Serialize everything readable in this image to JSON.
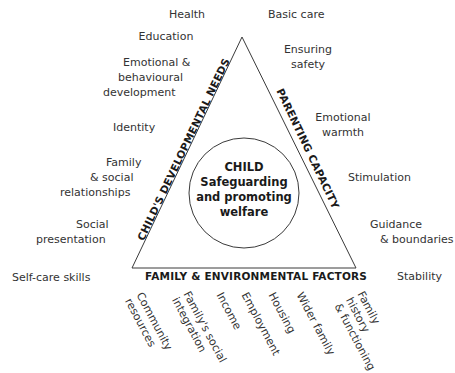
{
  "diagram": {
    "center": {
      "line1": "CHILD",
      "line2": "Safeguarding",
      "line3": "and promoting",
      "line4": "welfare"
    },
    "sides": {
      "left": "CHILD'S DEVELOPMENTAL NEEDS",
      "right": "PARENTING CAPACITY",
      "bottom": "FAMILY & ENVIRONMENTAL FACTORS"
    },
    "developmental_needs": [
      {
        "lines": [
          "Health"
        ]
      },
      {
        "lines": [
          "Education"
        ]
      },
      {
        "lines": [
          "Emotional &",
          "behavioural",
          "development"
        ]
      },
      {
        "lines": [
          "Identity"
        ]
      },
      {
        "lines": [
          "Family",
          "& social",
          "relationships"
        ]
      },
      {
        "lines": [
          "Social",
          "presentation"
        ]
      },
      {
        "lines": [
          "Self-care skills"
        ]
      }
    ],
    "parenting_capacity": [
      {
        "lines": [
          "Basic care"
        ]
      },
      {
        "lines": [
          "Ensuring",
          "safety"
        ]
      },
      {
        "lines": [
          "Emotional",
          "warmth"
        ]
      },
      {
        "lines": [
          "Stimulation"
        ]
      },
      {
        "lines": [
          "Guidance",
          "& boundaries"
        ]
      },
      {
        "lines": [
          "Stability"
        ]
      }
    ],
    "family_factors": [
      {
        "lines": [
          "Community",
          "resources"
        ]
      },
      {
        "lines": [
          "Family's social",
          "integration"
        ]
      },
      {
        "lines": [
          "Income"
        ]
      },
      {
        "lines": [
          "Employment"
        ]
      },
      {
        "lines": [
          "Housing"
        ]
      },
      {
        "lines": [
          "Wider family"
        ]
      },
      {
        "lines": [
          "Family",
          "history",
          "& functioning"
        ]
      }
    ],
    "colors": {
      "line": "#3a3a3a",
      "text": "#333333",
      "background": "#ffffff"
    }
  }
}
